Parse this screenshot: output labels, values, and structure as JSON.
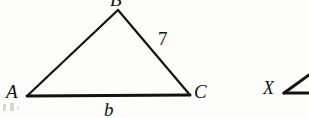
{
  "figure": {
    "kind": "geometry-diagram",
    "background_color": "#fdfdfb",
    "stroke_color": "#121212",
    "text_color": "#121212"
  },
  "triangle": {
    "name": "triangle-ABC",
    "vertices": [
      {
        "id": "A",
        "label": "A",
        "x": 27,
        "y": 96
      },
      {
        "id": "B",
        "label": "B",
        "x": 118,
        "y": 10
      },
      {
        "id": "C",
        "label": "C",
        "x": 190,
        "y": 95
      }
    ],
    "sides": [
      {
        "id": "AB",
        "from": "A",
        "to": "B",
        "label": "",
        "stroke_width": 2.2
      },
      {
        "id": "BC",
        "from": "B",
        "to": "C",
        "label": "7",
        "stroke_width": 2.2
      },
      {
        "id": "AC",
        "from": "A",
        "to": "C",
        "label": "b",
        "stroke_width": 3.0
      }
    ]
  },
  "labels": {
    "vertex_a": "A",
    "vertex_b": "B",
    "vertex_c": "C",
    "side_bc_measure": "7",
    "side_ac_measure": "b"
  },
  "right_fragment": {
    "name": "angle-expression-fragment",
    "variable": "X",
    "angle_symbol": "∠"
  }
}
